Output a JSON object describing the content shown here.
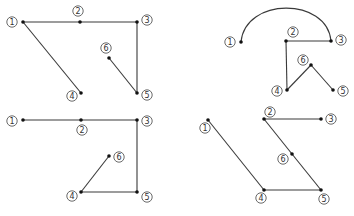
{
  "colors": {
    "edge": "#3a3a3a",
    "node": "#111111",
    "label": "#333333"
  },
  "diagrams": [
    {
      "id": "top-left",
      "nodes": [
        {
          "id": "1",
          "label": "1",
          "x": 23,
          "y": 22,
          "lx": 12,
          "ly": 22
        },
        {
          "id": "2",
          "label": "2",
          "x": 80,
          "y": 22,
          "lx": 78,
          "ly": 11
        },
        {
          "id": "3",
          "label": "3",
          "x": 137,
          "y": 22,
          "lx": 147,
          "ly": 20
        },
        {
          "id": "4",
          "label": "4",
          "x": 81,
          "y": 93,
          "lx": 72,
          "ly": 96
        },
        {
          "id": "5",
          "label": "5",
          "x": 137,
          "y": 93,
          "lx": 147,
          "ly": 95
        },
        {
          "id": "6",
          "label": "6",
          "x": 109,
          "y": 58,
          "lx": 106,
          "ly": 48
        }
      ],
      "edges": [
        {
          "from": "1",
          "to": "2",
          "type": "line"
        },
        {
          "from": "2",
          "to": "3",
          "type": "line"
        },
        {
          "from": "1",
          "to": "4",
          "type": "line"
        },
        {
          "from": "3",
          "to": "5",
          "type": "line"
        },
        {
          "from": "5",
          "to": "6",
          "type": "line"
        }
      ]
    },
    {
      "id": "top-right",
      "nodes": [
        {
          "id": "1",
          "label": "1",
          "x": 241,
          "y": 42,
          "lx": 230,
          "ly": 42
        },
        {
          "id": "2",
          "label": "2",
          "x": 286,
          "y": 41,
          "lx": 293,
          "ly": 32
        },
        {
          "id": "3",
          "label": "3",
          "x": 331,
          "y": 41,
          "lx": 341,
          "ly": 40
        },
        {
          "id": "4",
          "label": "4",
          "x": 287,
          "y": 90,
          "lx": 277,
          "ly": 91
        },
        {
          "id": "5",
          "label": "5",
          "x": 333,
          "y": 90,
          "lx": 343,
          "ly": 91
        },
        {
          "id": "6",
          "label": "6",
          "x": 311,
          "y": 65,
          "lx": 303,
          "ly": 60
        }
      ],
      "edges": [
        {
          "from": "1",
          "to": "3",
          "type": "arc",
          "peak": 8
        },
        {
          "from": "2",
          "to": "3",
          "type": "line"
        },
        {
          "from": "2",
          "to": "4",
          "type": "line"
        },
        {
          "from": "4",
          "to": "6",
          "type": "line"
        },
        {
          "from": "6",
          "to": "5",
          "type": "line"
        }
      ]
    },
    {
      "id": "bottom-left",
      "nodes": [
        {
          "id": "1",
          "label": "1",
          "x": 23,
          "y": 120,
          "lx": 12,
          "ly": 121
        },
        {
          "id": "2",
          "label": "2",
          "x": 81,
          "y": 120,
          "lx": 82,
          "ly": 130
        },
        {
          "id": "3",
          "label": "3",
          "x": 137,
          "y": 120,
          "lx": 147,
          "ly": 121
        },
        {
          "id": "4",
          "label": "4",
          "x": 81,
          "y": 192,
          "lx": 72,
          "ly": 196
        },
        {
          "id": "5",
          "label": "5",
          "x": 137,
          "y": 192,
          "lx": 147,
          "ly": 197
        },
        {
          "id": "6",
          "label": "6",
          "x": 109,
          "y": 156,
          "lx": 119,
          "ly": 157
        }
      ],
      "edges": [
        {
          "from": "1",
          "to": "2",
          "type": "line"
        },
        {
          "from": "2",
          "to": "3",
          "type": "line"
        },
        {
          "from": "3",
          "to": "5",
          "type": "line"
        },
        {
          "from": "5",
          "to": "4",
          "type": "line"
        },
        {
          "from": "4",
          "to": "6",
          "type": "line"
        }
      ]
    },
    {
      "id": "bottom-right",
      "nodes": [
        {
          "id": "1",
          "label": "1",
          "x": 208,
          "y": 120,
          "lx": 205,
          "ly": 128
        },
        {
          "id": "2",
          "label": "2",
          "x": 264,
          "y": 119,
          "lx": 270,
          "ly": 112
        },
        {
          "id": "3",
          "label": "3",
          "x": 321,
          "y": 119,
          "lx": 331,
          "ly": 119
        },
        {
          "id": "4",
          "label": "4",
          "x": 264,
          "y": 190,
          "lx": 261,
          "ly": 198
        },
        {
          "id": "5",
          "label": "5",
          "x": 321,
          "y": 190,
          "lx": 324,
          "ly": 199
        },
        {
          "id": "6",
          "label": "6",
          "x": 292,
          "y": 154,
          "lx": 283,
          "ly": 159
        }
      ],
      "edges": [
        {
          "from": "1",
          "to": "4",
          "type": "line"
        },
        {
          "from": "4",
          "to": "5",
          "type": "line"
        },
        {
          "from": "5",
          "to": "6",
          "type": "line"
        },
        {
          "from": "6",
          "to": "2",
          "type": "line"
        },
        {
          "from": "2",
          "to": "3",
          "type": "line"
        }
      ]
    }
  ]
}
